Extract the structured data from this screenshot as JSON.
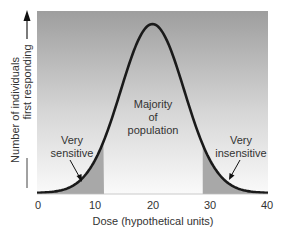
{
  "chart_data": {
    "type": "line",
    "title": "",
    "xlabel": "Dose (hypothetical units)",
    "ylabel_lines": [
      "Number of individuals",
      "first responding"
    ],
    "xlim": [
      0,
      40
    ],
    "x_ticks": [
      "0",
      "10",
      "20",
      "30",
      "40"
    ],
    "grid": false,
    "legend": "none",
    "series": [
      {
        "name": "Normal dose-response distribution",
        "shape": "gaussian",
        "mean": 20,
        "sd": 5.5,
        "x": [
          0,
          4,
          8,
          10,
          12,
          14,
          16,
          18,
          20,
          22,
          24,
          26,
          28,
          30,
          32,
          36,
          40
        ],
        "y_relative": [
          0.0,
          0.04,
          0.09,
          0.19,
          0.35,
          0.55,
          0.77,
          0.94,
          1.0,
          0.94,
          0.77,
          0.55,
          0.35,
          0.19,
          0.09,
          0.04,
          0.0
        ]
      }
    ],
    "shaded_regions": [
      {
        "from": 0,
        "to": 11.6,
        "label": "Very sensitive"
      },
      {
        "from": 28.7,
        "to": 40,
        "label": "Very insensitive"
      }
    ],
    "annotations": [
      {
        "text_lines": [
          "Very",
          "sensitive"
        ],
        "x": 7.5,
        "arrow": true
      },
      {
        "text_lines": [
          "Majority",
          "of",
          "population"
        ],
        "x": 20,
        "arrow": false
      },
      {
        "text_lines": [
          "Very",
          "insensitive"
        ],
        "x": 32,
        "arrow": true
      }
    ]
  },
  "labels": {
    "xlabel": "Dose (hypothetical units)",
    "ylabel1": "Number of individuals",
    "ylabel2": "first responding",
    "ticks": [
      "0",
      "10",
      "20",
      "30",
      "40"
    ],
    "sens1": "Very",
    "sens2": "sensitive",
    "maj1": "Majority",
    "maj2": "of",
    "maj3": "population",
    "ins1": "Very",
    "ins2": "insensitive"
  },
  "colors": {
    "curve": "#1a1a1a",
    "shade": "#a8a8a8",
    "background_top": "#a0a0a0",
    "background_bottom": "#f8f8f8"
  }
}
